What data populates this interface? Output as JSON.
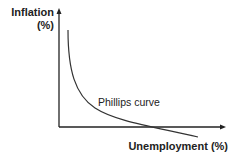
{
  "diagram": {
    "title": "",
    "y_axis_label_line1": "Inflation",
    "y_axis_label_line2": "(%)",
    "x_axis_label": "Unemployment (%)",
    "curve_label": "Phillips curve",
    "colors": {
      "axis": "#222222",
      "curve": "#333333",
      "background": "#ffffff"
    }
  }
}
